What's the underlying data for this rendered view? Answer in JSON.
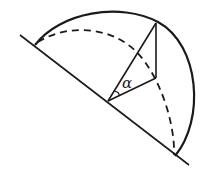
{
  "diagram": {
    "type": "geometry",
    "labels": {
      "angle": "α"
    },
    "colors": {
      "stroke": "#1a1a1a",
      "background": "#ffffff"
    }
  }
}
